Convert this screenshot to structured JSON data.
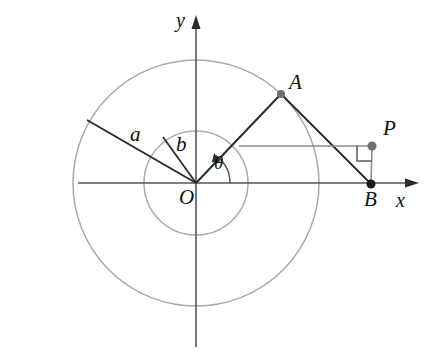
{
  "figure": {
    "axes": {
      "x_label": "x",
      "y_label": "y",
      "origin_label": "O"
    },
    "points": [
      {
        "name": "A",
        "label": "A",
        "x": 281,
        "y": 94
      },
      {
        "name": "B",
        "label": "B",
        "x": 371,
        "y": 184
      },
      {
        "name": "P",
        "label": "P",
        "x": 372,
        "y": 146
      },
      {
        "name": "O",
        "label": "O",
        "x": 196,
        "y": 183
      }
    ],
    "lengths": {
      "outer_radius_label": "a",
      "inner_radius_label": "b"
    },
    "angle": {
      "label": "θ"
    },
    "colors": {
      "stroke_dark": "#2b2b2b",
      "stroke_gray": "#8a8a8a",
      "circle_gray": "#a9a9a9",
      "point_fill": "#6e6e6e",
      "background": "#ffffff"
    },
    "geometry": {
      "origin": {
        "x": 196,
        "y": 183
      },
      "outer_circle_radius": 123,
      "inner_circle_radius": 52,
      "segment_a_end": {
        "x": 87,
        "y": 120
      },
      "segment_b_end": {
        "x": 162,
        "y": 136
      },
      "horizontal_line": {
        "x1": 239,
        "y1": 146,
        "x2": 372,
        "y2": 146
      },
      "x_axis": {
        "x1": 78,
        "y1": 183,
        "x2": 417,
        "y2": 183
      },
      "y_axis": {
        "x1": 196,
        "y1": 18,
        "x2": 196,
        "y2": 347
      },
      "theta_arc_radius": 34
    }
  }
}
